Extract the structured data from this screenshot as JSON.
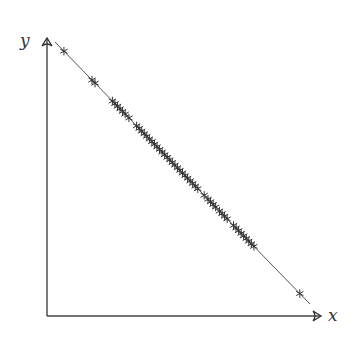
{
  "chart_data": {
    "type": "scatter",
    "title": "",
    "xlabel": "x",
    "ylabel": "y",
    "grid": false,
    "legend": null,
    "xlim": [
      0,
      1
    ],
    "ylim": [
      0,
      1
    ],
    "line": {
      "description": "straight line y = 1 - x",
      "from": [
        0,
        1
      ],
      "to": [
        1,
        0
      ],
      "color": "#555555"
    },
    "marker": "asterisk",
    "marker_color": "#333333",
    "x": [
      0.035,
      0.145,
      0.157,
      0.225,
      0.235,
      0.245,
      0.255,
      0.265,
      0.275,
      0.29,
      0.32,
      0.33,
      0.34,
      0.35,
      0.36,
      0.37,
      0.38,
      0.39,
      0.4,
      0.41,
      0.42,
      0.43,
      0.44,
      0.45,
      0.46,
      0.47,
      0.48,
      0.49,
      0.5,
      0.51,
      0.52,
      0.53,
      0.54,
      0.55,
      0.56,
      0.585,
      0.6,
      0.61,
      0.62,
      0.63,
      0.645,
      0.655,
      0.665,
      0.675,
      0.7,
      0.71,
      0.72,
      0.73,
      0.74,
      0.75,
      0.76,
      0.77,
      0.78,
      0.96
    ],
    "y_rule": "y = 1 - x"
  },
  "axes": {
    "x_label": "x",
    "y_label": "y"
  }
}
